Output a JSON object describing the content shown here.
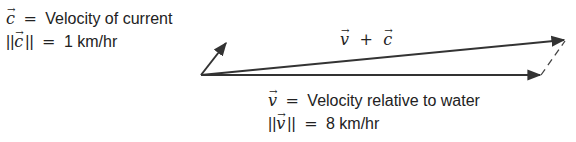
{
  "current": {
    "symbol": "c",
    "definition_eq": "=",
    "definition": "Velocity of current",
    "magnitude_open": "||",
    "magnitude_close": "||",
    "magnitude_eq": "=",
    "magnitude_value": "1 km/hr"
  },
  "water": {
    "symbol": "v",
    "definition_eq": "=",
    "definition": "Velocity relative to water",
    "magnitude_open": "||",
    "magnitude_close": "||",
    "magnitude_eq": "=",
    "magnitude_value": "8 km/hr"
  },
  "sum": {
    "left": "v",
    "operator": "+",
    "right": "c"
  },
  "diagram": {
    "origin": [
      201,
      75
    ],
    "vector_c_tip": [
      227,
      42
    ],
    "vector_v_tip": [
      541,
      75
    ],
    "vector_sum_tip": [
      565,
      40
    ],
    "stroke_color": "#333333"
  }
}
